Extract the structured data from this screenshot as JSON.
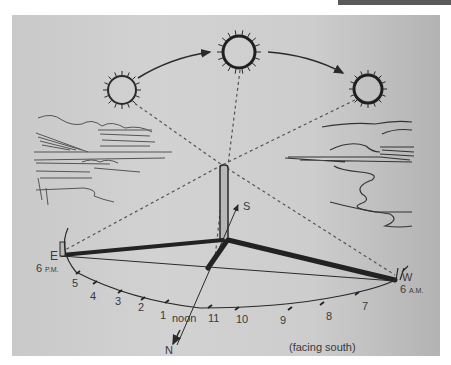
{
  "figure": {
    "directions": {
      "east": "E",
      "west": "W",
      "south": "S",
      "north": "N"
    },
    "times": {
      "east_time": "6",
      "east_suffix": "P.M.",
      "west_time": "6",
      "west_suffix": "A.M.",
      "noon": "noon"
    },
    "hour_labels_afternoon": [
      "5",
      "4",
      "3",
      "2",
      "1"
    ],
    "hour_labels_morning": [
      "11",
      "10",
      "9",
      "8",
      "7"
    ],
    "caption": "(facing south)",
    "suns": [
      "morning-sun",
      "noon-sun",
      "evening-sun"
    ],
    "colors": {
      "ink": "#2a2a2a",
      "paper": "#cdcdcd"
    }
  }
}
